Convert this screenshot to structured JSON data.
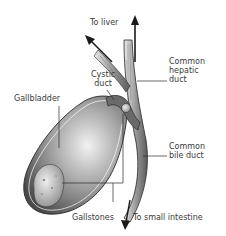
{
  "diagram": {
    "labels": {
      "to_liver": "To liver",
      "common_hepatic_duct": "Common\nhepatic\nduct",
      "cystic_duct": "Cystic\nduct",
      "gallbladder": "Gallbladder",
      "common_bile_duct": "Common\nbile duct",
      "gallstones": "Gallstones",
      "to_small_intestine": "To small intestine"
    },
    "colors": {
      "line": "#2a2a2a",
      "label_text": "#3a3a3a",
      "shade_dark": "#555555",
      "shade_light": "#d8d8d8",
      "stone": "#c8c8c8"
    }
  }
}
